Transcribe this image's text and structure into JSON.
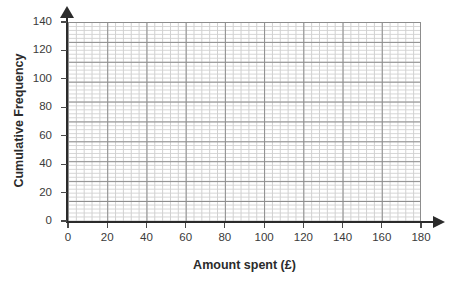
{
  "chart_data": {
    "type": "line",
    "title": "",
    "subtitle": "",
    "xlabel": "Amount spent (£)",
    "ylabel": "Cumulative Frequency",
    "xlim": [
      0,
      180
    ],
    "ylim": [
      0,
      140
    ],
    "x_ticks": [
      0,
      20,
      40,
      60,
      80,
      100,
      120,
      140,
      160,
      180
    ],
    "y_ticks": [
      0,
      20,
      40,
      60,
      80,
      100,
      120,
      140
    ],
    "x_tick_labels": [
      "0",
      "20",
      "40",
      "60",
      "80",
      "100",
      "120",
      "140",
      "160",
      "180"
    ],
    "y_tick_labels": [
      "0",
      "20",
      "40",
      "60",
      "80",
      "100",
      "120",
      "140"
    ],
    "x_major_step": 20,
    "y_major_step": 20,
    "x_minor_step": 4,
    "y_minor_step": 2.8,
    "minor_divisions_per_major": 5,
    "grid": true,
    "grid_style": "graph-paper",
    "legend": false,
    "legend_position": "none",
    "series": [],
    "values": [],
    "categories": [],
    "annotations": [],
    "note": "Blank cumulative frequency graph paper; no data plotted."
  },
  "axes": {
    "y": {
      "title": "Cumulative Frequency",
      "ticks": [
        {
          "value": 0,
          "label": "0"
        },
        {
          "value": 20,
          "label": "20"
        },
        {
          "value": 40,
          "label": "40"
        },
        {
          "value": 60,
          "label": "60"
        },
        {
          "value": 80,
          "label": "80"
        },
        {
          "value": 100,
          "label": "100"
        },
        {
          "value": 120,
          "label": "120"
        },
        {
          "value": 140,
          "label": "140"
        }
      ]
    },
    "x": {
      "title": "Amount spent (£)",
      "ticks": [
        {
          "value": 0,
          "label": "0"
        },
        {
          "value": 20,
          "label": "20"
        },
        {
          "value": 40,
          "label": "40"
        },
        {
          "value": 60,
          "label": "60"
        },
        {
          "value": 80,
          "label": "80"
        },
        {
          "value": 100,
          "label": "100"
        },
        {
          "value": 120,
          "label": "120"
        },
        {
          "value": 140,
          "label": "140"
        },
        {
          "value": 160,
          "label": "160"
        },
        {
          "value": 180,
          "label": "180"
        }
      ]
    }
  },
  "colors": {
    "background": "#ffffff",
    "axis": "#2b2b2b",
    "grid_major": "#8d8d8d",
    "grid_minor": "#c9c9c9",
    "tick_label": "#3a3a3a",
    "title": "#2b2b2b"
  }
}
